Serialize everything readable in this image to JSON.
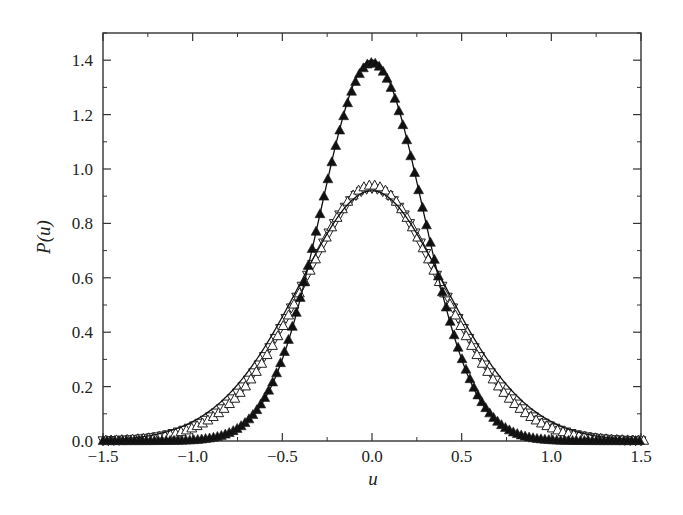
{
  "chart_data": {
    "type": "scatter",
    "title": "",
    "xlabel": "u",
    "ylabel": "P(u)",
    "xlim": [
      -1.5,
      1.5
    ],
    "ylim": [
      0.0,
      1.5
    ],
    "xticks": [
      "-1.5",
      "-1.0",
      "-0.5",
      "0.0",
      "0.5",
      "1.0",
      "1.5"
    ],
    "xtick_values": [
      -1.5,
      -1.0,
      -0.5,
      0.0,
      0.5,
      1.0,
      1.5
    ],
    "yticks": [
      "0.0",
      "0.2",
      "0.4",
      "0.6",
      "0.8",
      "1.0",
      "1.2",
      "1.4"
    ],
    "ytick_values": [
      0.0,
      0.2,
      0.4,
      0.6,
      0.8,
      1.0,
      1.2,
      1.4
    ],
    "grid": false,
    "legend": null,
    "series": [
      {
        "name": "narrow distribution (filled up-triangles)",
        "marker": "filled-triangle-up",
        "peak": 1.39,
        "sigma": 0.287,
        "center": 0.0
      },
      {
        "name": "broad distribution (open up-triangles)",
        "marker": "open-triangle-up",
        "peak": 0.94,
        "sigma": 0.42,
        "center": 0.0
      },
      {
        "name": "broad distribution (open down-triangles)",
        "marker": "open-triangle-down",
        "peak": 0.93,
        "sigma": 0.43,
        "center": 0.0
      },
      {
        "name": "fit narrow (solid line)",
        "marker": "line",
        "peak": 1.4,
        "sigma": 0.285,
        "center": 0.0
      },
      {
        "name": "fit broad (solid line)",
        "marker": "line",
        "peak": 0.92,
        "sigma": 0.435,
        "center": 0.0
      }
    ],
    "sample_points": {
      "x": [
        -1.5,
        -1.25,
        -1.0,
        -0.75,
        -0.5,
        -0.25,
        0.0,
        0.25,
        0.5,
        0.75,
        1.0,
        1.25,
        1.5
      ],
      "narrow": [
        0.0,
        0.0,
        0.003,
        0.045,
        0.3,
        0.95,
        1.39,
        0.95,
        0.3,
        0.045,
        0.003,
        0.0,
        0.0
      ],
      "broad": [
        0.01,
        0.03,
        0.08,
        0.25,
        0.55,
        0.83,
        0.93,
        0.83,
        0.55,
        0.25,
        0.08,
        0.03,
        0.01
      ]
    }
  }
}
